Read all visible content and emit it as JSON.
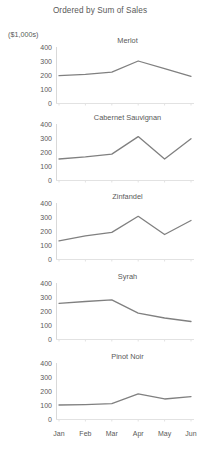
{
  "chart_data": {
    "type": "line",
    "title": "Ordered by Sum of Sales",
    "ylabel": "($1,000s)",
    "xlabel": "",
    "categories": [
      "Jan",
      "Feb",
      "Mar",
      "Apr",
      "May",
      "Jun"
    ],
    "ylim": [
      0,
      400
    ],
    "yticks": [
      400,
      300,
      200,
      100,
      0
    ],
    "grid": false,
    "legend": "none",
    "layout": "small-multiples-vertical",
    "line_color": "#808080",
    "series": [
      {
        "name": "Merlot",
        "values": [
          195,
          205,
          220,
          300,
          245,
          190
        ]
      },
      {
        "name": "Cabernet Sauvignan",
        "values": [
          150,
          165,
          185,
          310,
          150,
          295
        ]
      },
      {
        "name": "Zinfandel",
        "values": [
          130,
          165,
          190,
          305,
          175,
          275
        ]
      },
      {
        "name": "Syrah",
        "values": [
          255,
          268,
          280,
          185,
          150,
          125
        ]
      },
      {
        "name": "Pinot Noir",
        "values": [
          100,
          103,
          110,
          180,
          143,
          160
        ]
      }
    ]
  },
  "panels": [
    {
      "title": "Merlot"
    },
    {
      "title": "Cabernet Sauvignan"
    },
    {
      "title": "Zinfandel"
    },
    {
      "title": "Syrah"
    },
    {
      "title": "Pinot Noir"
    }
  ],
  "footer": {
    "clipped_text": ""
  }
}
